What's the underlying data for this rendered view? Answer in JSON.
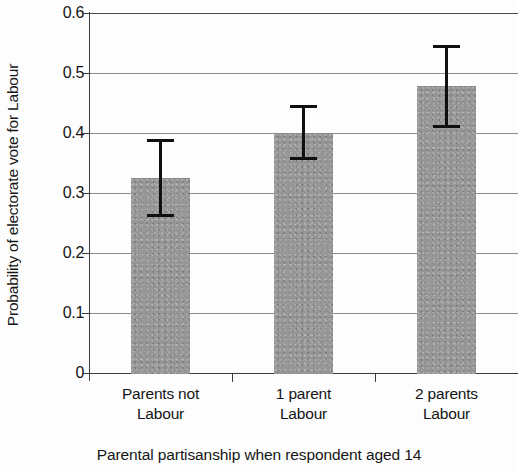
{
  "chart_data": {
    "type": "bar",
    "title": "",
    "xlabel": "Parental partisanship when respondent aged 14",
    "ylabel": "Probability of electorate vote for Labour",
    "categories": [
      "Parents not Labour",
      "1 parent Labour",
      "2 parents Labour"
    ],
    "category_lines": [
      [
        "Parents not",
        "Labour"
      ],
      [
        "1 parent",
        "Labour"
      ],
      [
        "2 parents",
        "Labour"
      ]
    ],
    "values": [
      0.325,
      0.4,
      0.478
    ],
    "errors_low": [
      0.26,
      0.355,
      0.408
    ],
    "errors_high": [
      0.39,
      0.447,
      0.547
    ],
    "ylim": [
      0,
      0.6
    ],
    "yticks": [
      0,
      0.1,
      0.2,
      0.3,
      0.4,
      0.5,
      0.6
    ],
    "ytick_labels": [
      "0",
      "0.1",
      "0.2",
      "0.3",
      "0.4",
      "0.5",
      "0.6"
    ],
    "grid": true,
    "legend": false,
    "bar_color": "#979797",
    "error_bar_color": "#101010",
    "axis_color": "#3a3a3a",
    "gridline_color": "#8d8d8d"
  }
}
